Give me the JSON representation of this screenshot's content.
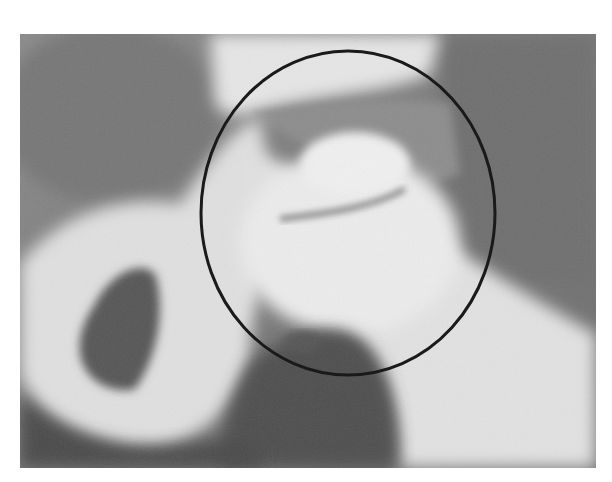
{
  "image": {
    "subject": "grayscale radiograph of hip joint",
    "annotation": {
      "type": "circle",
      "stroke_color": "#1a1a1a",
      "description": "circle highlighting femoral head / acetabulum"
    },
    "colors": {
      "background": "#ffffff",
      "soft_tissue": "#7a7a7a",
      "bone": "#e8e8e8",
      "dark_region": "#4a4a4a"
    }
  }
}
